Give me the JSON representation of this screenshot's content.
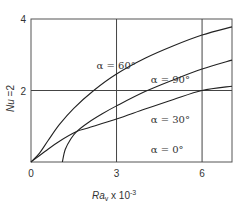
{
  "chart_data": {
    "type": "line",
    "title": "",
    "xlabel": "Ra_v x 10^-3",
    "xlabel_main": "Ra",
    "xlabel_sub": "v",
    "xlabel_rest": " x 10",
    "xlabel_exp": "-3",
    "ylabel": "Nu =2",
    "ylabel_main": "Nu",
    "ylabel_rest": " =2",
    "xlim": [
      0,
      7.05
    ],
    "ylim": [
      0,
      4
    ],
    "x_ticks": [
      0,
      3,
      6
    ],
    "x_tick_labels": [
      "0",
      "3",
      "6"
    ],
    "y_ticks": [
      2,
      4
    ],
    "y_tick_labels": [
      "2",
      "4"
    ],
    "origin_label": "0",
    "grid": {
      "x": [
        3,
        6
      ],
      "y": [
        2
      ]
    },
    "legend": "none (inline annotations)",
    "series": [
      {
        "name": "α = 60°",
        "label": "α = 60°",
        "x": [
          0,
          0.3,
          0.6,
          1.0,
          1.5,
          2.2,
          3.0,
          4.0,
          5.0,
          6.0,
          7.05
        ],
        "y": [
          0,
          0.25,
          0.6,
          1.05,
          1.5,
          2.0,
          2.46,
          2.9,
          3.25,
          3.55,
          3.78
        ]
      },
      {
        "name": "α = 90°",
        "label": "α = 90°",
        "x": [
          1.1,
          1.2,
          1.4,
          1.6,
          2.0,
          2.5,
          3.0,
          4.0,
          5.0,
          6.0,
          7.05
        ],
        "y": [
          0,
          0.35,
          0.65,
          0.85,
          1.1,
          1.35,
          1.57,
          1.97,
          2.3,
          2.6,
          2.85
        ],
        "x_intercept": 1.1
      },
      {
        "name": "α = 30°",
        "label": "α = 30°",
        "x": [
          0,
          0.5,
          1.0,
          1.6,
          2.0,
          3.0,
          4.0,
          5.0,
          6.0,
          7.05
        ],
        "y": [
          0,
          0.3,
          0.58,
          0.85,
          0.95,
          1.2,
          1.48,
          1.75,
          2.0,
          2.12
        ]
      }
    ],
    "annotations": [
      {
        "text": "α = 60°",
        "x": 2.3,
        "y": 2.6
      },
      {
        "text": "α = 90°",
        "x": 4.2,
        "y": 2.2
      },
      {
        "text": "α = 30°",
        "x": 4.2,
        "y": 1.1
      },
      {
        "text": "α = 0°",
        "x": 4.2,
        "y": 0.25
      }
    ]
  }
}
